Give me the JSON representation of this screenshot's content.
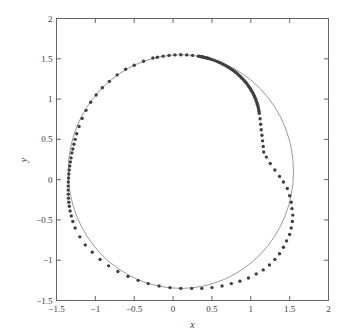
{
  "chart_data": {
    "type": "scatter",
    "title": "",
    "subtitle": "",
    "xlabel": "x",
    "ylabel": "y",
    "xlim": [
      -1.5,
      2
    ],
    "ylim": [
      -1.5,
      2
    ],
    "xticks": [
      -1.5,
      -1,
      -0.5,
      0,
      0.5,
      1,
      1.5,
      2
    ],
    "yticks": [
      -1.5,
      -1,
      -0.5,
      0,
      0.5,
      1,
      1.5,
      2
    ],
    "xtick_labels": [
      "−1.5",
      "−1",
      "−0.5",
      "0",
      "0.5",
      "1",
      "1.5",
      "2"
    ],
    "ytick_labels": [
      "−1.5",
      "−1",
      "−0.5",
      "0",
      "0.5",
      "1",
      "1.5",
      "2"
    ],
    "grid": false,
    "legend": null,
    "legend_position": "none",
    "marker_color": "#404040",
    "line_color": "#555555",
    "axis_color": "#555555",
    "marker_size": 1.7,
    "line_width": 0.6,
    "curve": {
      "shape": "circle",
      "center_x": 0.1,
      "center_y": 0.1,
      "radius": 1.45
    },
    "points": [
      {
        "x": 0.1,
        "y": 1.55,
        "t": 90
      },
      {
        "x": 0.0235,
        "y": 1.548,
        "t": 93
      },
      {
        "x": -0.0526,
        "y": 1.5423,
        "t": 96
      },
      {
        "x": -0.128,
        "y": 1.5328,
        "t": 99
      },
      {
        "x": -0.2025,
        "y": 1.5196,
        "t": 102
      },
      {
        "x": 0.1758,
        "y": 1.5481,
        "t": 87
      },
      {
        "x": 0.2513,
        "y": 1.5423,
        "t": 84
      },
      {
        "x": 0.3262,
        "y": 1.5328,
        "t": 81
      },
      {
        "x": 0.34,
        "y": 1.5305,
        "t": 80.4
      },
      {
        "x": 0.3537,
        "y": 1.528,
        "t": 79.8
      },
      {
        "x": 0.3673,
        "y": 1.5253,
        "t": 79.2
      },
      {
        "x": 0.3809,
        "y": 1.5225,
        "t": 78.6
      },
      {
        "x": 0.3944,
        "y": 1.5196,
        "t": 78
      },
      {
        "x": 0.4078,
        "y": 1.5165,
        "t": 77.4
      },
      {
        "x": 0.4212,
        "y": 1.5133,
        "t": 76.8
      },
      {
        "x": 0.4345,
        "y": 1.5099,
        "t": 76.2
      },
      {
        "x": 0.4477,
        "y": 1.5064,
        "t": 75.6
      },
      {
        "x": 0.4608,
        "y": 1.5027,
        "t": 75
      },
      {
        "x": 0.4869,
        "y": 1.4949,
        "t": 73.8
      },
      {
        "x": 0.5126,
        "y": 1.4865,
        "t": 72.6
      },
      {
        "x": 0.538,
        "y": 1.4776,
        "t": 71.4
      },
      {
        "x": 0.5631,
        "y": 1.468,
        "t": 70.2
      },
      {
        "x": 0.5878,
        "y": 1.4579,
        "t": 69
      },
      {
        "x": 0.6121,
        "y": 1.4472,
        "t": 67.8
      },
      {
        "x": 0.636,
        "y": 1.4359,
        "t": 66.6
      },
      {
        "x": 0.6595,
        "y": 1.4241,
        "t": 65.4
      },
      {
        "x": 0.6826,
        "y": 1.4117,
        "t": 64.2
      },
      {
        "x": 0.7053,
        "y": 1.3987,
        "t": 63
      },
      {
        "x": 0.7275,
        "y": 1.3853,
        "t": 61.8
      },
      {
        "x": 0.7492,
        "y": 1.3713,
        "t": 60.6
      },
      {
        "x": 0.7704,
        "y": 1.3568,
        "t": 59.4
      },
      {
        "x": 0.7911,
        "y": 1.3418,
        "t": 58.2
      },
      {
        "x": 0.8113,
        "y": 1.3263,
        "t": 57
      },
      {
        "x": 0.831,
        "y": 1.3103,
        "t": 55.8
      },
      {
        "x": 0.8501,
        "y": 1.2939,
        "t": 54.6
      },
      {
        "x": 0.8686,
        "y": 1.277,
        "t": 53.4
      },
      {
        "x": 0.8866,
        "y": 1.2597,
        "t": 52.2
      },
      {
        "x": 0.9039,
        "y": 1.2419,
        "t": 51
      },
      {
        "x": 0.9207,
        "y": 1.2238,
        "t": 49.8
      },
      {
        "x": 0.9368,
        "y": 1.2052,
        "t": 48.6
      },
      {
        "x": 0.9523,
        "y": 1.1863,
        "t": 47.4
      },
      {
        "x": 0.9671,
        "y": 1.167,
        "t": 46.2
      },
      {
        "x": 0.9813,
        "y": 1.1474,
        "t": 45
      },
      {
        "x": 0.9949,
        "y": 1.1274,
        "t": 43.8
      },
      {
        "x": 1.0077,
        "y": 1.1071,
        "t": 42.6
      },
      {
        "x": 1.0199,
        "y": 1.0866,
        "t": 41.4
      },
      {
        "x": 1.0314,
        "y": 1.0657,
        "t": 40.2
      },
      {
        "x": 1.0421,
        "y": 1.0446,
        "t": 39
      },
      {
        "x": 1.0522,
        "y": 1.0233,
        "t": 37.8
      },
      {
        "x": 1.0615,
        "y": 1.0017,
        "t": 36.6
      },
      {
        "x": 1.0701,
        "y": 0.98,
        "t": 35.4
      },
      {
        "x": 1.078,
        "y": 0.9581,
        "t": 34.2
      },
      {
        "x": 1.0851,
        "y": 0.936,
        "t": 33
      },
      {
        "x": 1.0915,
        "y": 0.9138,
        "t": 31.8
      },
      {
        "x": 1.0971,
        "y": 0.8914,
        "t": 30.6
      },
      {
        "x": 1.102,
        "y": 0.869,
        "t": 29.4
      },
      {
        "x": 1.1061,
        "y": 0.8465,
        "t": 28.2
      },
      {
        "x": 1.1094,
        "y": 0.8239,
        "t": 27
      },
      {
        "x": 1.1193,
        "y": 0.7559,
        "t": 23.4
      },
      {
        "x": 1.1273,
        "y": 0.6876,
        "t": 19.8
      },
      {
        "x": 1.1334,
        "y": 0.619,
        "t": 16.2
      },
      {
        "x": 1.1436,
        "y": 0.5502,
        "t": 12.6
      },
      {
        "x": 1.1518,
        "y": 0.4813,
        "t": 9
      },
      {
        "x": 1.1602,
        "y": 0.4124,
        "t": 5.4
      },
      {
        "x": 1.1663,
        "y": 0.3434,
        "t": 1.8
      },
      {
        "x": 1.2,
        "y": 0.28,
        "t": -2
      },
      {
        "x": 1.25,
        "y": 0.2,
        "t": -6
      },
      {
        "x": 1.31,
        "y": 0.12,
        "t": -10
      },
      {
        "x": 1.37,
        "y": 0.04,
        "t": -14
      },
      {
        "x": 1.42,
        "y": -0.03,
        "t": -18
      },
      {
        "x": 1.47,
        "y": -0.11,
        "t": -22
      },
      {
        "x": 1.5,
        "y": -0.2,
        "t": -26
      },
      {
        "x": 1.52,
        "y": -0.28,
        "t": -30
      },
      {
        "x": 1.53,
        "y": -0.36,
        "t": -34
      },
      {
        "x": 1.54,
        "y": -0.44,
        "t": -38
      },
      {
        "x": 1.535,
        "y": -0.52,
        "t": -42
      },
      {
        "x": 1.52,
        "y": -0.6,
        "t": -46
      },
      {
        "x": 1.5,
        "y": -0.68,
        "t": -50
      },
      {
        "x": 1.46,
        "y": -0.76,
        "t": -54
      },
      {
        "x": 1.42,
        "y": -0.84,
        "t": -58
      },
      {
        "x": 1.37,
        "y": -0.92,
        "t": -62
      },
      {
        "x": 1.31,
        "y": -0.99,
        "t": -66
      },
      {
        "x": 1.24,
        "y": -1.06,
        "t": -70
      },
      {
        "x": 1.16,
        "y": -1.12,
        "t": -74
      },
      {
        "x": 1.07,
        "y": -1.17,
        "t": -78
      },
      {
        "x": 0.97,
        "y": -1.22,
        "t": -82
      },
      {
        "x": 0.86,
        "y": -1.26,
        "t": -86
      },
      {
        "x": 0.75,
        "y": -1.29,
        "t": -90
      },
      {
        "x": 0.63,
        "y": -1.32,
        "t": -94
      },
      {
        "x": 0.5,
        "y": -1.34,
        "t": -98
      },
      {
        "x": 0.37,
        "y": -1.35,
        "t": -102
      },
      {
        "x": 0.24,
        "y": -1.35,
        "t": -106
      },
      {
        "x": 0.1,
        "y": -1.35,
        "t": -110
      },
      {
        "x": -0.04,
        "y": -1.34,
        "t": -114
      },
      {
        "x": -0.18,
        "y": -1.32,
        "t": -118
      },
      {
        "x": -0.32,
        "y": -1.29,
        "t": -122
      },
      {
        "x": -0.45,
        "y": -1.25,
        "t": -126
      },
      {
        "x": -0.58,
        "y": -1.2,
        "t": -130
      },
      {
        "x": -0.71,
        "y": -1.14,
        "t": -134
      },
      {
        "x": -0.83,
        "y": -1.07,
        "t": -138
      },
      {
        "x": -0.94,
        "y": -0.99,
        "t": -142
      },
      {
        "x": -1.04,
        "y": -0.9,
        "t": -146
      },
      {
        "x": -1.13,
        "y": -0.81,
        "t": -150
      },
      {
        "x": -1.2,
        "y": -0.71,
        "t": -154
      },
      {
        "x": -1.26,
        "y": -0.6,
        "t": -158
      },
      {
        "x": -1.29,
        "y": -0.52,
        "t": -161
      },
      {
        "x": -1.31,
        "y": -0.45,
        "t": -164
      },
      {
        "x": -1.325,
        "y": -0.39,
        "t": -167
      },
      {
        "x": -1.335,
        "y": -0.33,
        "t": -170
      },
      {
        "x": -1.341,
        "y": -0.28,
        "t": -173
      },
      {
        "x": -1.346,
        "y": -0.23,
        "t": -176
      },
      {
        "x": -1.349,
        "y": -0.18,
        "t": -179
      },
      {
        "x": -1.35,
        "y": -0.13,
        "t": -182
      },
      {
        "x": -1.3495,
        "y": -0.08,
        "t": -185
      },
      {
        "x": -1.348,
        "y": -0.03,
        "t": -188
      },
      {
        "x": -1.345,
        "y": 0.02,
        "t": -191
      },
      {
        "x": -1.341,
        "y": 0.07,
        "t": -194
      },
      {
        "x": -1.336,
        "y": 0.12,
        "t": -197
      },
      {
        "x": -1.33,
        "y": 0.17,
        "t": -200
      },
      {
        "x": -1.322,
        "y": 0.22,
        "t": -203
      },
      {
        "x": -1.313,
        "y": 0.27,
        "t": -206
      },
      {
        "x": -1.302,
        "y": 0.33,
        "t": -209
      },
      {
        "x": -1.29,
        "y": 0.38,
        "t": -212
      },
      {
        "x": -1.276,
        "y": 0.44,
        "t": -215
      },
      {
        "x": -1.26,
        "y": 0.5,
        "t": -218
      },
      {
        "x": -1.24,
        "y": 0.57,
        "t": -221
      },
      {
        "x": -1.21,
        "y": 0.66,
        "t": -225
      },
      {
        "x": -1.17,
        "y": 0.76,
        "t": -229
      },
      {
        "x": -1.12,
        "y": 0.86,
        "t": -233
      },
      {
        "x": -1.06,
        "y": 0.96,
        "t": -237
      },
      {
        "x": -0.99,
        "y": 1.05,
        "t": -241
      },
      {
        "x": -0.91,
        "y": 1.14,
        "t": -245
      },
      {
        "x": -0.82,
        "y": 1.22,
        "t": -249
      },
      {
        "x": -0.72,
        "y": 1.3,
        "t": -253
      },
      {
        "x": -0.61,
        "y": 1.37,
        "t": -257
      },
      {
        "x": -0.5,
        "y": 1.42,
        "t": -261
      },
      {
        "x": -0.38,
        "y": 1.47,
        "t": -265
      },
      {
        "x": -0.26,
        "y": 1.51,
        "t": -269
      }
    ]
  }
}
